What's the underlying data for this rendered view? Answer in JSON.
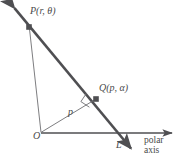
{
  "figure": {
    "type": "polar-line-geometry-diagram",
    "colors": {
      "stroke_thick": "#4f4f52",
      "stroke_thin": "#6e6e72",
      "text": "#4a4a4a",
      "background": "#ffffff"
    },
    "labels": {
      "point_p": "P(r,  θ)",
      "point_q": "Q(p,  α)",
      "origin": "O",
      "distance_p": "p",
      "line_l": "L",
      "axis_line1": "polar",
      "axis_line2": "axis"
    },
    "geometry": {
      "origin": [
        41,
        133
      ],
      "point_p": [
        29,
        27
      ],
      "point_q": [
        96,
        99
      ],
      "line_l_start": [
        11,
        4
      ],
      "line_l_end": [
        135,
        153
      ],
      "axis_start": [
        41,
        133
      ],
      "axis_end": [
        176,
        133
      ]
    }
  }
}
